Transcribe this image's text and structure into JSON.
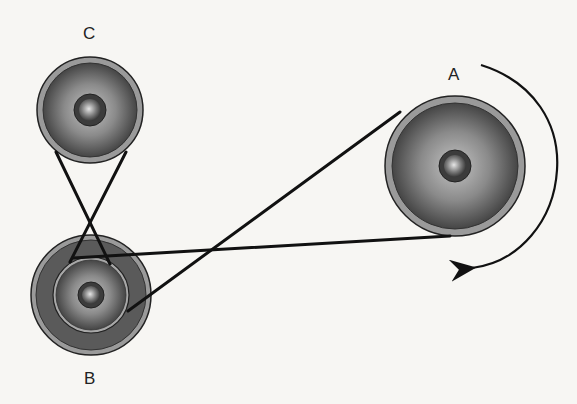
{
  "diagram": {
    "type": "belt-pulley-system",
    "pulleys": [
      {
        "id": "A",
        "label": "A",
        "cx": 455,
        "cy": 166,
        "r_outer": 70,
        "r_inner": 64,
        "r_hub": 16
      },
      {
        "id": "B",
        "label": "B",
        "cx": 91,
        "cy": 295,
        "r_outer": 60,
        "r_inner": 55,
        "r_step": 38,
        "r_hub": 13
      },
      {
        "id": "C",
        "label": "C",
        "cx": 90,
        "cy": 110,
        "r_outer": 53,
        "r_inner": 48,
        "r_hub": 16
      }
    ],
    "belts": [
      {
        "from": "A",
        "to": "B",
        "style": "open",
        "segments": [
          [
            400,
            112,
            128,
            311
          ],
          [
            450,
            236,
            73,
            258
          ]
        ]
      },
      {
        "from": "C",
        "to": "B",
        "style": "crossed",
        "segments": [
          [
            56,
            152,
            110,
            264
          ],
          [
            126,
            152,
            70,
            262
          ]
        ]
      }
    ],
    "rotation_arrow": {
      "around": "A",
      "direction": "clockwise"
    },
    "colors": {
      "background": "#f7f6f3",
      "belt": "#111111",
      "rim": "#8e8e8e",
      "disc_dark": "#4a4a4a",
      "disc_light": "#b9b9b9"
    }
  },
  "labels": {
    "a": "A",
    "b": "B",
    "c": "C"
  }
}
